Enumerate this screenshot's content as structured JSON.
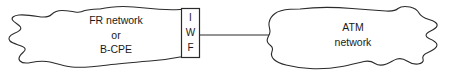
{
  "diagram": {
    "type": "network-topology",
    "width": 462,
    "height": 80,
    "background_color": "#ffffff",
    "stroke_color": "#2b2b2b",
    "text_color": "#1a1a1a",
    "left_cloud": {
      "name": "fr-network-cloud",
      "shape": "cloud",
      "line1": "FR network",
      "line2": "or",
      "line3": "B-CPE"
    },
    "interworking_box": {
      "name": "iwf-box",
      "shape": "rectangle",
      "letter1": "I",
      "letter2": "W",
      "letter3": "F"
    },
    "right_cloud": {
      "name": "atm-network-cloud",
      "shape": "cloud",
      "line1": "ATM",
      "line2": "network"
    },
    "connector": {
      "name": "iwf-to-atm-link",
      "style": "solid-line"
    }
  }
}
